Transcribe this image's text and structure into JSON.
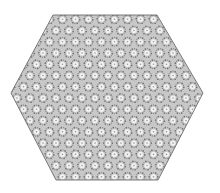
{
  "figure": {
    "shape": "hexagon",
    "vertices": [
      [
        53,
        15
      ],
      [
        157,
        15
      ],
      [
        203,
        93
      ],
      [
        158,
        180
      ],
      [
        56,
        180
      ],
      [
        11,
        93
      ]
    ],
    "colors": {
      "background": "#ffffff",
      "fill": "#c8c8c8",
      "outline": "#6e6e6e",
      "dot_dark": "#5a5a5a",
      "ring_light": "#f2f2f2"
    },
    "pattern": {
      "cell_spacing": 13,
      "dot_spacing": 4.3
    }
  }
}
